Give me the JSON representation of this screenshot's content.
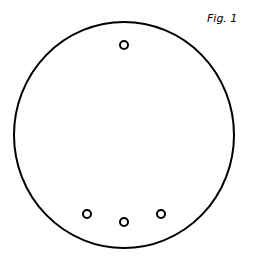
{
  "figure": {
    "label": "Fig. 1",
    "stroke_color": "#000000",
    "background_color": "#ffffff",
    "outer_circle": {
      "cx": 124,
      "cy": 135,
      "rx": 110,
      "ry": 113,
      "stroke_width": 2
    },
    "small_circles": [
      {
        "cx": 124,
        "cy": 45,
        "r": 4,
        "stroke_width": 2
      },
      {
        "cx": 87,
        "cy": 214,
        "r": 4,
        "stroke_width": 2
      },
      {
        "cx": 124,
        "cy": 222,
        "r": 4,
        "stroke_width": 2
      },
      {
        "cx": 161,
        "cy": 214,
        "r": 4,
        "stroke_width": 2
      }
    ]
  }
}
